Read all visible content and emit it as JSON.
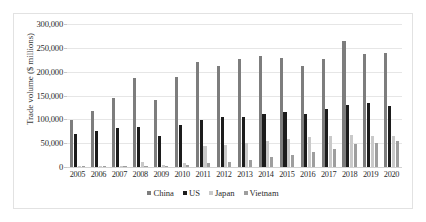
{
  "chart_data": {
    "type": "bar",
    "title": "",
    "xlabel": "",
    "ylabel": "Trade volume ($ millions)",
    "ylim": [
      0,
      300000
    ],
    "yticks": [
      0,
      50000,
      100000,
      150000,
      200000,
      250000,
      300000
    ],
    "ytick_labels": [
      "0",
      "50,000",
      "100,000",
      "150,000",
      "200,000",
      "250,000",
      "300,000"
    ],
    "grid": true,
    "legend_position": "bottom",
    "categories": [
      "2005",
      "2006",
      "2007",
      "2008",
      "2009",
      "2010",
      "2011",
      "2012",
      "2013",
      "2014",
      "2015",
      "2016",
      "2017",
      "2018",
      "2019",
      "2020"
    ],
    "series": [
      {
        "name": "China",
        "color": "#7d7d7d",
        "values": [
          98000,
          118000,
          144000,
          186000,
          140000,
          189000,
          220000,
          212000,
          227000,
          232000,
          228000,
          212000,
          226000,
          265000,
          238000,
          240000
        ]
      },
      {
        "name": "US",
        "color": "#1c1c1c",
        "values": [
          70000,
          75000,
          81000,
          83000,
          66000,
          88000,
          99000,
          104000,
          105000,
          111000,
          115000,
          111000,
          121000,
          131000,
          134000,
          128000
        ]
      },
      {
        "name": "Japan",
        "color": "#c9c9c9",
        "values": [
          2000,
          2500,
          3000,
          10000,
          4000,
          8000,
          45000,
          47000,
          50000,
          55000,
          59000,
          62000,
          65000,
          67000,
          66000,
          65000
        ]
      },
      {
        "name": "Vietnam",
        "color": "#9e9e9e",
        "values": [
          1200,
          1500,
          2000,
          3000,
          2000,
          3500,
          9000,
          11000,
          14000,
          22000,
          26000,
          32000,
          38000,
          48000,
          51000,
          54000
        ]
      }
    ]
  },
  "legend": {
    "items": [
      {
        "label": "China"
      },
      {
        "label": "US"
      },
      {
        "label": "Japan"
      },
      {
        "label": "Vietnam"
      }
    ]
  }
}
